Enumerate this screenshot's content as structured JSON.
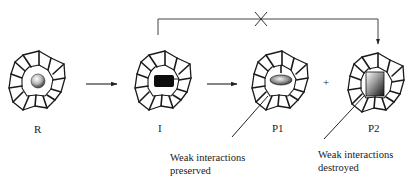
{
  "diagram": {
    "type": "reaction-scheme",
    "species": [
      {
        "id": "R",
        "label": "R",
        "guest_shape": "sphere",
        "description": "guest sphere inside cage"
      },
      {
        "id": "I",
        "label": "I",
        "guest_shape": "black-rectangle",
        "description": "intermediate inside cage"
      },
      {
        "id": "P1",
        "label": "P1",
        "guest_shape": "ellipse",
        "description": "product with preserved cage contacts"
      },
      {
        "id": "P2",
        "label": "P2",
        "guest_shape": "shaded-rectangle",
        "description": "product with broken cage contacts"
      }
    ],
    "arrows": [
      {
        "from": "R",
        "to": "I",
        "style": "forward"
      },
      {
        "from": "I",
        "to": "P1",
        "style": "forward"
      },
      {
        "from": "I",
        "to": "P2",
        "style": "bracket-over-top",
        "blocked": true,
        "block_mark": "X"
      }
    ],
    "plus_sign": "+",
    "annotations": [
      {
        "target": "P1",
        "lines": [
          "Weak interactions",
          "preserved"
        ]
      },
      {
        "target": "P2",
        "lines": [
          "Weak interactions",
          "destroyed"
        ]
      }
    ]
  }
}
